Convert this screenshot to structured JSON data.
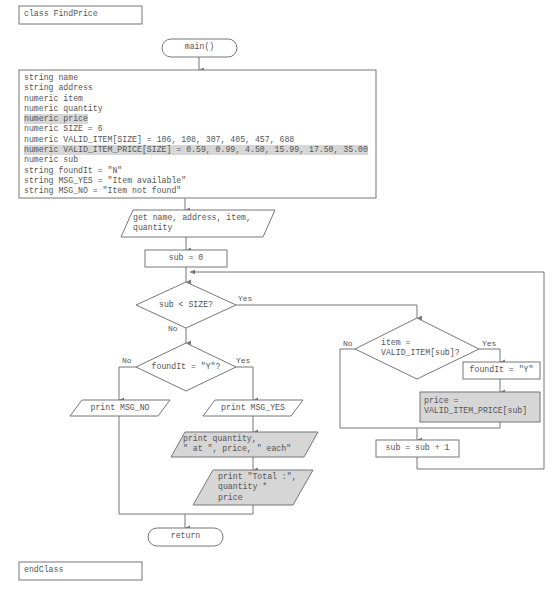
{
  "class_header": "class FindPrice",
  "class_footer": "endClass",
  "start_terminal": "main()",
  "end_terminal": "return",
  "declarations": [
    {
      "text": "string name",
      "highlighted": false
    },
    {
      "text": "string address",
      "highlighted": false
    },
    {
      "text": "numeric item",
      "highlighted": false
    },
    {
      "text": "numeric quantity",
      "highlighted": false
    },
    {
      "text": "numeric price",
      "highlighted": true
    },
    {
      "text": "numeric SIZE = 6",
      "highlighted": false
    },
    {
      "text": "numeric VALID_ITEM[SIZE] = 106, 108, 307, 405, 457, 688",
      "highlighted": false
    },
    {
      "text": "numeric VALID_ITEM_PRICE[SIZE] = 0.59, 0.99, 4.50, 15.99, 17.50, 35.00",
      "highlighted": true
    },
    {
      "text": "numeric sub",
      "highlighted": false
    },
    {
      "text": "string foundIt = \"N\"",
      "highlighted": false
    },
    {
      "text": "string MSG_YES = \"Item available\"",
      "highlighted": false
    },
    {
      "text": "string MSG_NO = \"Item not found\"",
      "highlighted": false
    }
  ],
  "input_step": "get name, address, item,\nquantity",
  "init_step": "sub = 0",
  "loop_decision": "sub < SIZE?",
  "match_decision": "item =\nVALID_ITEM[sub]?",
  "set_found": "foundIt = \"Y\"",
  "set_price": "price =\nVALID_ITEM_PRICE[sub]",
  "increment": "sub = sub + 1",
  "found_decision": "foundIt = \"Y\"?",
  "print_no": "print MSG_NO",
  "print_yes": "print MSG_YES",
  "print_each": "print quantity,\n\" at \", price, \" each\"",
  "print_total": "print \"Total :\",\nquantity *\nprice",
  "labels": {
    "yes": "Yes",
    "no": "No"
  },
  "colors": {
    "line": "#777777",
    "highlight": "#d6d6d6"
  }
}
